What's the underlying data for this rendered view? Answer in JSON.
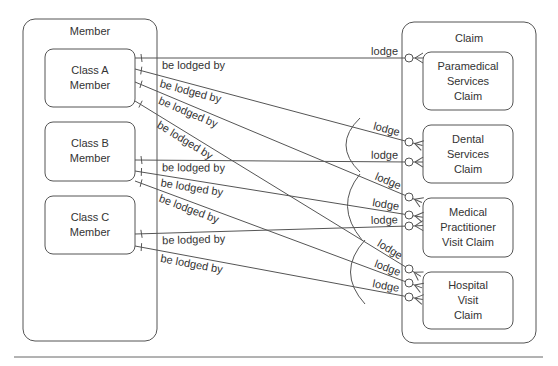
{
  "diagram": {
    "member_group": {
      "title": "Member",
      "entities": [
        {
          "id": "class-a",
          "lines": [
            "Class A",
            "Member"
          ]
        },
        {
          "id": "class-b",
          "lines": [
            "Class B",
            "Member"
          ]
        },
        {
          "id": "class-c",
          "lines": [
            "Class C",
            "Member"
          ]
        }
      ]
    },
    "claim_group": {
      "title": "Claim",
      "entities": [
        {
          "id": "paramedical",
          "lines": [
            "Paramedical",
            "Services",
            "Claim"
          ]
        },
        {
          "id": "dental",
          "lines": [
            "Dental",
            "Services",
            "Claim"
          ]
        },
        {
          "id": "medical",
          "lines": [
            "Medical",
            "Practitioner",
            "Visit Claim"
          ]
        },
        {
          "id": "hospital",
          "lines": [
            "Hospital",
            "Visit",
            "Claim"
          ]
        }
      ]
    },
    "relationships": [
      {
        "from": "class-a",
        "to": "paramedical",
        "member_label": "be lodged by",
        "claim_label": "lodge"
      },
      {
        "from": "class-a",
        "to": "dental",
        "member_label": "be lodged by",
        "claim_label": "lodge"
      },
      {
        "from": "class-a",
        "to": "medical",
        "member_label": "be lodged by",
        "claim_label": "lodge"
      },
      {
        "from": "class-a",
        "to": "hospital",
        "member_label": "be lodged by",
        "claim_label": "lodge"
      },
      {
        "from": "class-b",
        "to": "dental",
        "member_label": "be lodged by",
        "claim_label": "lodge"
      },
      {
        "from": "class-b",
        "to": "medical",
        "member_label": "be lodged by",
        "claim_label": "lodge"
      },
      {
        "from": "class-b",
        "to": "hospital",
        "member_label": "be lodged by",
        "claim_label": "lodge"
      },
      {
        "from": "class-c",
        "to": "medical",
        "member_label": "be lodged by",
        "claim_label": "lodge"
      },
      {
        "from": "class-c",
        "to": "hospital",
        "member_label": "be lodged by",
        "claim_label": "lodge"
      }
    ],
    "exclusivity_arcs": [
      {
        "covers": [
          "dental"
        ]
      },
      {
        "covers": [
          "medical"
        ]
      },
      {
        "covers": [
          "hospital"
        ]
      }
    ],
    "notation": {
      "member_end": "one (bar)",
      "claim_end": "zero-or-many (circle + crow's foot)"
    }
  }
}
